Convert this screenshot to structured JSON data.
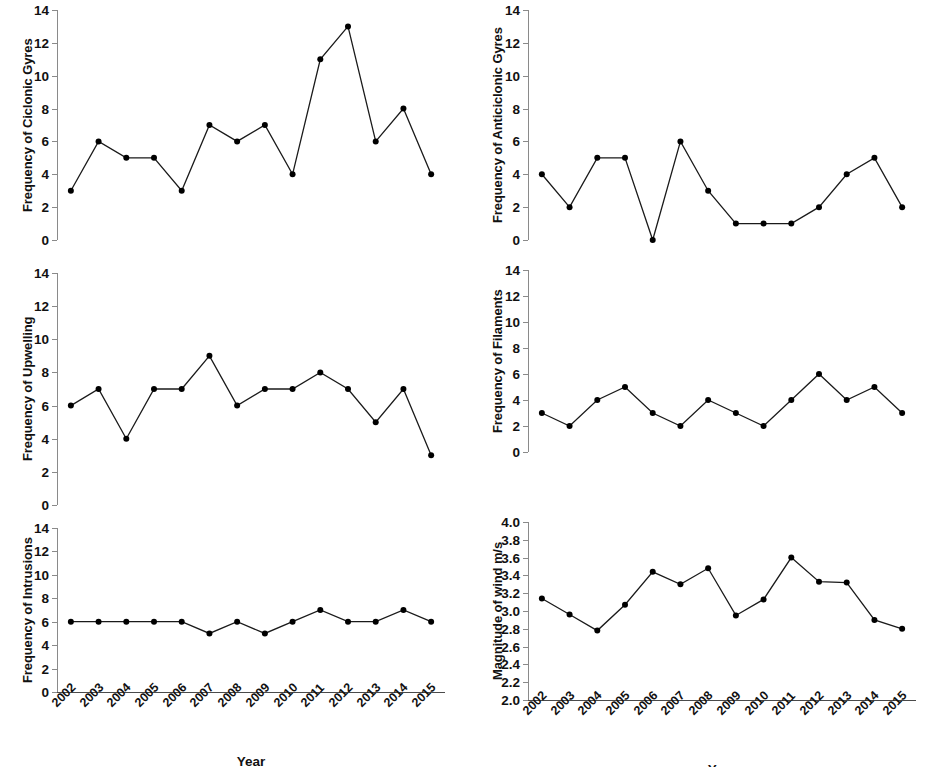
{
  "figure": {
    "width": 936,
    "height": 767,
    "background": "#ffffff",
    "line_color": "#1a1a1a",
    "marker_color": "#000000",
    "axis_color": "#8a8a8a",
    "xaxis_title": "Year",
    "categories": [
      "2002",
      "2003",
      "2004",
      "2005",
      "2006",
      "2007",
      "2008",
      "2009",
      "2010",
      "2011",
      "2012",
      "2013",
      "2014",
      "2015"
    ]
  },
  "chart_data": [
    {
      "id": "ciclonic-gyres",
      "type": "line",
      "title": "",
      "ylabel": "Frequency of Ciclonic Gyres",
      "xlabel": "",
      "categories": [
        "2002",
        "2003",
        "2004",
        "2005",
        "2006",
        "2007",
        "2008",
        "2009",
        "2010",
        "2011",
        "2012",
        "2013",
        "2014",
        "2015"
      ],
      "values": [
        3,
        6,
        5,
        5,
        3,
        7,
        6,
        7,
        4,
        11,
        13,
        6,
        8,
        4
      ],
      "ylim": [
        0,
        14
      ],
      "ytick_step": 2,
      "yticks": [
        0,
        2,
        4,
        6,
        8,
        10,
        12,
        14
      ],
      "ytick_labels": [
        "0",
        "2",
        "4",
        "6",
        "8",
        "10",
        "12",
        "14"
      ],
      "grid": false,
      "legend": "none",
      "show_xticklabels": false
    },
    {
      "id": "anticiclonic-gyres",
      "type": "line",
      "title": "",
      "ylabel": "Frequency of Anticiclonic Gyres",
      "xlabel": "",
      "categories": [
        "2002",
        "2003",
        "2004",
        "2005",
        "2006",
        "2007",
        "2008",
        "2009",
        "2010",
        "2011",
        "2012",
        "2013",
        "2014",
        "2015"
      ],
      "values": [
        4,
        2,
        5,
        5,
        0,
        6,
        3,
        1,
        1,
        1,
        2,
        4,
        5,
        2
      ],
      "ylim": [
        0,
        14
      ],
      "ytick_step": 2,
      "yticks": [
        0,
        2,
        4,
        6,
        8,
        10,
        12,
        14
      ],
      "ytick_labels": [
        "0",
        "2",
        "4",
        "6",
        "8",
        "10",
        "12",
        "14"
      ],
      "grid": false,
      "legend": "none",
      "show_xticklabels": false
    },
    {
      "id": "upwelling",
      "type": "line",
      "title": "",
      "ylabel": "Frequency of Upwelling",
      "xlabel": "",
      "categories": [
        "2002",
        "2003",
        "2004",
        "2005",
        "2006",
        "2007",
        "2008",
        "2009",
        "2010",
        "2011",
        "2012",
        "2013",
        "2014",
        "2015"
      ],
      "values": [
        6,
        7,
        4,
        7,
        7,
        9,
        6,
        7,
        7,
        8,
        7,
        5,
        7,
        3
      ],
      "ylim": [
        0,
        14
      ],
      "ytick_step": 2,
      "yticks": [
        0,
        2,
        4,
        6,
        8,
        10,
        12,
        14
      ],
      "ytick_labels": [
        "0",
        "2",
        "4",
        "6",
        "8",
        "10",
        "12",
        "14"
      ],
      "grid": false,
      "legend": "none",
      "show_xticklabels": false
    },
    {
      "id": "filaments",
      "type": "line",
      "title": "",
      "ylabel": "Frequency of Filaments",
      "xlabel": "",
      "categories": [
        "2002",
        "2003",
        "2004",
        "2005",
        "2006",
        "2007",
        "2008",
        "2009",
        "2010",
        "2011",
        "2012",
        "2013",
        "2014",
        "2015"
      ],
      "values": [
        3,
        2,
        4,
        5,
        3,
        2,
        4,
        3,
        2,
        4,
        6,
        4,
        5,
        3
      ],
      "ylim": [
        0,
        14
      ],
      "ytick_step": 2,
      "yticks": [
        0,
        2,
        4,
        6,
        8,
        10,
        12,
        14
      ],
      "ytick_labels": [
        "0",
        "2",
        "4",
        "6",
        "8",
        "10",
        "12",
        "14"
      ],
      "grid": false,
      "legend": "none",
      "show_xticklabels": false
    },
    {
      "id": "intrusions",
      "type": "line",
      "title": "",
      "ylabel": "Frequency of Intrusions",
      "xlabel": "Year",
      "categories": [
        "2002",
        "2003",
        "2004",
        "2005",
        "2006",
        "2007",
        "2008",
        "2009",
        "2010",
        "2011",
        "2012",
        "2013",
        "2014",
        "2015"
      ],
      "values": [
        6,
        6,
        6,
        6,
        6,
        5,
        6,
        5,
        6,
        7,
        6,
        6,
        7,
        6
      ],
      "ylim": [
        0,
        14
      ],
      "ytick_step": 2,
      "yticks": [
        0,
        2,
        4,
        6,
        8,
        10,
        12,
        14
      ],
      "ytick_labels": [
        "0",
        "2",
        "4",
        "6",
        "8",
        "10",
        "12",
        "14"
      ],
      "grid": false,
      "legend": "none",
      "show_xticklabels": true
    },
    {
      "id": "wind-magnitude",
      "type": "line",
      "title": "",
      "ylabel": "Magnitude of wind m/s",
      "xlabel": "Year",
      "categories": [
        "2002",
        "2003",
        "2004",
        "2005",
        "2006",
        "2007",
        "2008",
        "2009",
        "2010",
        "2011",
        "2012",
        "2013",
        "2014",
        "2015"
      ],
      "values": [
        3.14,
        2.96,
        2.78,
        3.07,
        3.44,
        3.3,
        3.48,
        2.95,
        3.13,
        3.6,
        3.33,
        3.32,
        2.9,
        2.8
      ],
      "ylim": [
        2.0,
        4.0
      ],
      "ytick_step": 0.2,
      "yticks": [
        2.0,
        2.2,
        2.4,
        2.6,
        2.8,
        3.0,
        3.2,
        3.4,
        3.6,
        3.8,
        4.0
      ],
      "ytick_labels": [
        "2.0",
        "2.2",
        "2.4",
        "2.6",
        "2.8",
        "3.0",
        "3.2",
        "3.4",
        "3.6",
        "3.8",
        "4.0"
      ],
      "grid": false,
      "legend": "none",
      "show_xticklabels": true
    }
  ],
  "layout": {
    "panels": [
      {
        "chart": 0,
        "left": 0,
        "top": 0,
        "plot_x": 57,
        "plot_y": 10,
        "plot_w": 388,
        "plot_h": 230,
        "ylabel_x": 20,
        "ylabel_center_y": 125,
        "xlabel_center_x": 251
      },
      {
        "chart": 1,
        "left": 468,
        "top": 0,
        "plot_x": 528,
        "plot_y": 10,
        "plot_w": 388,
        "plot_h": 230,
        "ylabel_x": 490,
        "ylabel_center_y": 125,
        "xlabel_center_x": 722
      },
      {
        "chart": 2,
        "left": 0,
        "top": 0,
        "plot_x": 57,
        "plot_y": 273,
        "plot_w": 388,
        "plot_h": 232,
        "ylabel_x": 20,
        "ylabel_center_y": 389,
        "xlabel_center_x": 251
      },
      {
        "chart": 3,
        "left": 0,
        "top": 0,
        "plot_x": 528,
        "plot_y": 270,
        "plot_w": 388,
        "plot_h": 182,
        "ylabel_x": 490,
        "ylabel_center_y": 361,
        "xlabel_center_x": 722
      },
      {
        "chart": 4,
        "left": 0,
        "top": 0,
        "plot_x": 57,
        "plot_y": 528,
        "plot_w": 388,
        "plot_h": 164,
        "ylabel_x": 20,
        "ylabel_center_y": 610,
        "xlabel_center_x": 251
      },
      {
        "chart": 5,
        "left": 0,
        "top": 0,
        "plot_x": 528,
        "plot_y": 522,
        "plot_w": 388,
        "plot_h": 178,
        "ylabel_x": 490,
        "ylabel_center_y": 611,
        "xlabel_center_x": 722
      }
    ]
  }
}
